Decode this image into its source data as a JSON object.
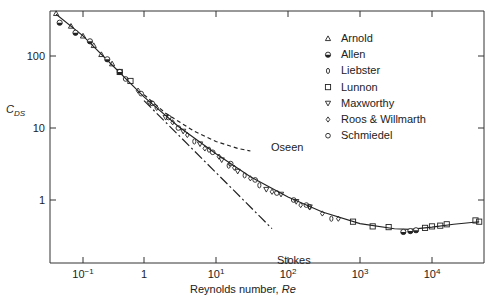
{
  "chart_data": {
    "type": "scatter",
    "title": "",
    "xlabel": "Reynolds number, Re",
    "xlabel_plain": "Reynolds number, ",
    "xlabel_italic": "Re",
    "ylabel": "C_DS",
    "ylabel_main": "C",
    "ylabel_sub": "DS",
    "xscale": "log",
    "yscale": "log",
    "xlim": [
      0.04,
      50000
    ],
    "ylim": [
      0.1,
      420
    ],
    "grid": false,
    "legend_position": "upper right",
    "x_ticks": [
      {
        "value": 0.1,
        "label_base": "10",
        "label_exp": "−1"
      },
      {
        "value": 1,
        "label_base": "1",
        "label_exp": ""
      },
      {
        "value": 10,
        "label_base": "10",
        "label_exp": "1"
      },
      {
        "value": 100,
        "label_base": "10",
        "label_exp": "2"
      },
      {
        "value": 1000,
        "label_base": "10",
        "label_exp": "3"
      },
      {
        "value": 10000,
        "label_base": "10",
        "label_exp": "4"
      }
    ],
    "y_ticks": [
      {
        "value": 1,
        "label": "1"
      },
      {
        "value": 10,
        "label": "10"
      },
      {
        "value": 100,
        "label": "100"
      }
    ],
    "legend": [
      {
        "name": "Arnold",
        "marker": "triangle-up-open"
      },
      {
        "name": "Allen",
        "marker": "circle-half-filled"
      },
      {
        "name": "Liebster",
        "marker": "ellipse-open"
      },
      {
        "name": "Lunnon",
        "marker": "square-open"
      },
      {
        "name": "Maxworthy",
        "marker": "triangle-down-open"
      },
      {
        "name": "Roos & Willmarth",
        "marker": "diamond-open"
      },
      {
        "name": "Schmiedel",
        "marker": "circle-open"
      }
    ],
    "curves": [
      {
        "name": "Experimental fit",
        "style": "solid",
        "x": [
          0.045,
          0.1,
          0.3,
          1,
          3,
          10,
          30,
          100,
          300,
          1000,
          3000,
          5000,
          10000,
          20000,
          45000
        ],
        "y": [
          380,
          190,
          75,
          27,
          10.5,
          4.4,
          2.1,
          1.1,
          0.68,
          0.47,
          0.4,
          0.39,
          0.42,
          0.46,
          0.5
        ]
      },
      {
        "name": "Oseen",
        "style": "dashed",
        "label": "Oseen",
        "x": [
          1,
          2,
          5,
          10,
          20,
          30
        ],
        "y": [
          29,
          16,
          9,
          6.5,
          5.2,
          4.8
        ]
      },
      {
        "name": "Stokes",
        "style": "dash-dot",
        "label": "Stokes",
        "x": [
          1,
          3,
          10,
          30,
          60
        ],
        "y": [
          24,
          8,
          2.4,
          0.8,
          0.4
        ]
      }
    ],
    "series": [
      {
        "name": "Arnold",
        "marker": "triangle-up-open",
        "x": [
          0.045,
          0.07,
          0.1,
          0.15,
          0.2,
          0.3
        ],
        "y": [
          390,
          260,
          190,
          140,
          105,
          78
        ]
      },
      {
        "name": "Allen",
        "marker": "circle-half-filled",
        "x": [
          0.05,
          0.08,
          0.13,
          0.25,
          0.4,
          4000,
          5000,
          6000
        ],
        "y": [
          290,
          210,
          160,
          90,
          60,
          0.36,
          0.37,
          0.38
        ]
      },
      {
        "name": "Liebster",
        "marker": "ellipse-open",
        "x": [
          5,
          8,
          15,
          25,
          40,
          200,
          400
        ],
        "y": [
          6.5,
          5,
          3,
          2.2,
          1.6,
          0.8,
          0.55
        ]
      },
      {
        "name": "Lunnon",
        "marker": "square-open",
        "x": [
          0.4,
          0.6,
          800,
          1500,
          2500,
          8000,
          10000,
          13000,
          16000,
          40000,
          45000
        ],
        "y": [
          60,
          45,
          0.5,
          0.43,
          0.42,
          0.41,
          0.43,
          0.44,
          0.46,
          0.52,
          0.5
        ]
      },
      {
        "name": "Maxworthy",
        "marker": "triangle-down-open",
        "x": [
          1.2,
          2,
          3.5,
          6,
          12,
          20,
          50,
          80,
          130,
          200
        ],
        "y": [
          22,
          14,
          9,
          6,
          3.6,
          2.5,
          1.4,
          1.2,
          0.95,
          0.8
        ]
      },
      {
        "name": "Roos & Willmarth",
        "marker": "diamond-open",
        "x": [
          0.8,
          1.5,
          2.5,
          4,
          7,
          11,
          18,
          30,
          60,
          150,
          300,
          500
        ],
        "y": [
          33,
          19,
          12,
          8,
          5.2,
          4,
          2.8,
          2,
          1.3,
          0.85,
          0.65,
          0.55
        ]
      },
      {
        "name": "Schmiedel",
        "marker": "circle-open",
        "x": [
          0.5,
          0.9,
          1.3,
          2.2,
          3,
          9,
          16,
          35,
          70,
          120,
          180
        ],
        "y": [
          48,
          30,
          22,
          14,
          10,
          4.6,
          3.2,
          1.9,
          1.25,
          1.0,
          0.85
        ]
      }
    ]
  },
  "ui": {
    "annotations": {
      "oseen": "Oseen",
      "stokes": "Stokes"
    }
  }
}
